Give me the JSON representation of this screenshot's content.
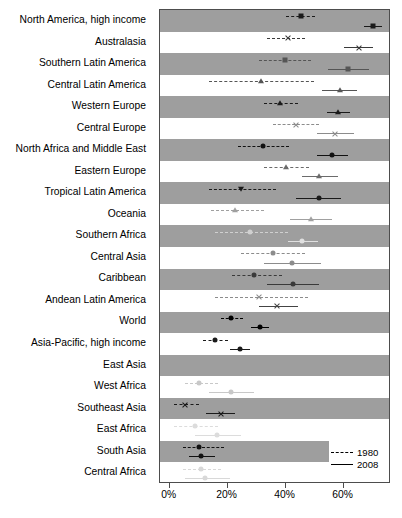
{
  "chart_data": {
    "type": "scatter",
    "title": "",
    "subtitle": "",
    "xlabel": "",
    "ylabel": "",
    "xlim": [
      -3,
      76
    ],
    "grid": false,
    "legend_position": "bottom-right",
    "axis": {
      "ticks": [
        0,
        20,
        40,
        60
      ],
      "tick_labels": [
        "0%",
        "20%",
        "40%",
        "60%"
      ]
    },
    "legend": [
      {
        "name": "1980",
        "style": "dashed",
        "label": "1980"
      },
      {
        "name": "2008",
        "style": "solid",
        "label": "2008"
      }
    ],
    "categories": [
      "North America, high income",
      "Australasia",
      "Southern Latin America",
      "Central Latin America",
      "Western Europe",
      "Central Europe",
      "North Africa and Middle East",
      "Eastern Europe",
      "Tropical Latin America",
      "Oceania",
      "Southern Africa",
      "Central Asia",
      "Caribbean",
      "Andean Latin America",
      "World",
      "Asia-Pacific, high income",
      "East Asia",
      "West Africa",
      "Southeast Asia",
      "East Africa",
      "South Asia",
      "Central Africa"
    ],
    "series": [
      {
        "name": "1980",
        "style": "dashed",
        "points": [
          {
            "category": "North America, high income",
            "value": 45.5,
            "low": 40.5,
            "high": 50.5,
            "marker": "square",
            "color": "#1a1a1a"
          },
          {
            "category": "Australasia",
            "value": 41.0,
            "low": 34.0,
            "high": 47.0,
            "marker": "cross",
            "color": "#3a3a3a"
          },
          {
            "category": "Southern Latin America",
            "value": 40.0,
            "low": 31.0,
            "high": 49.0,
            "marker": "square",
            "color": "#555555"
          },
          {
            "category": "Central Latin America",
            "value": 32.0,
            "low": 14.0,
            "high": 50.0,
            "marker": "triangle",
            "color": "#555555"
          },
          {
            "category": "Western Europe",
            "value": 38.5,
            "low": 33.0,
            "high": 44.5,
            "marker": "triangle",
            "color": "#1a1a1a"
          },
          {
            "category": "Central Europe",
            "value": 44.0,
            "low": 36.0,
            "high": 52.0,
            "marker": "cross",
            "color": "#8c8c8c"
          },
          {
            "category": "North Africa and Middle East",
            "value": 32.5,
            "low": 24.0,
            "high": 41.5,
            "marker": "circle",
            "color": "#111111"
          },
          {
            "category": "Eastern Europe",
            "value": 40.5,
            "low": 33.0,
            "high": 48.5,
            "marker": "triangle",
            "color": "#6b6b6b"
          },
          {
            "category": "Tropical Latin America",
            "value": 25.0,
            "low": 14.0,
            "high": 37.0,
            "marker": "tri-down",
            "color": "#1a1a1a"
          },
          {
            "category": "Oceania",
            "value": 23.0,
            "low": 14.5,
            "high": 33.0,
            "marker": "triangle",
            "color": "#a0a0a0"
          },
          {
            "category": "Southern Africa",
            "value": 28.0,
            "low": 16.0,
            "high": 41.0,
            "marker": "circle",
            "color": "#d0d0d0"
          },
          {
            "category": "Central Asia",
            "value": 36.0,
            "low": 25.0,
            "high": 47.0,
            "marker": "circle",
            "color": "#8c8c8c"
          },
          {
            "category": "Caribbean",
            "value": 29.5,
            "low": 22.0,
            "high": 39.0,
            "marker": "circle",
            "color": "#3a3a3a"
          },
          {
            "category": "Andean Latin America",
            "value": 31.0,
            "low": 16.0,
            "high": 48.0,
            "marker": "cross",
            "color": "#8c8c8c"
          },
          {
            "category": "World",
            "value": 21.5,
            "low": 18.0,
            "high": 25.5,
            "marker": "circle",
            "color": "#000000"
          },
          {
            "category": "Asia-Pacific, high income",
            "value": 16.0,
            "low": 12.0,
            "high": 20.5,
            "marker": "circle",
            "color": "#1a1a1a"
          },
          {
            "category": "East Asia",
            "value": null,
            "low": null,
            "high": null,
            "marker": "circle",
            "color": "#c8c8c8"
          },
          {
            "category": "West Africa",
            "value": 10.5,
            "low": 5.5,
            "high": 17.0,
            "marker": "circle",
            "color": "#c8c8c8"
          },
          {
            "category": "Southeast Asia",
            "value": 5.5,
            "low": 2.0,
            "high": 10.5,
            "marker": "cross",
            "color": "#1a1a1a"
          },
          {
            "category": "East Africa",
            "value": 9.0,
            "low": 2.0,
            "high": 17.0,
            "marker": "circle",
            "color": "#dcdcdc"
          },
          {
            "category": "South Asia",
            "value": 10.5,
            "low": 5.0,
            "high": 19.0,
            "marker": "circle",
            "color": "#111111"
          },
          {
            "category": "Central Africa",
            "value": 11.0,
            "low": 5.0,
            "high": 18.0,
            "marker": "circle",
            "color": "#d8d8d8"
          }
        ]
      },
      {
        "name": "2008",
        "style": "solid",
        "points": [
          {
            "category": "North America, high income",
            "value": 70.5,
            "low": 67.5,
            "high": 73.5,
            "marker": "square",
            "color": "#1a1a1a"
          },
          {
            "category": "Australasia",
            "value": 65.5,
            "low": 60.5,
            "high": 70.5,
            "marker": "cross",
            "color": "#3a3a3a"
          },
          {
            "category": "Southern Latin America",
            "value": 62.0,
            "low": 55.0,
            "high": 69.0,
            "marker": "square",
            "color": "#555555"
          },
          {
            "category": "Central Latin America",
            "value": 59.0,
            "low": 53.0,
            "high": 65.0,
            "marker": "triangle",
            "color": "#555555"
          },
          {
            "category": "Western Europe",
            "value": 58.5,
            "low": 54.5,
            "high": 62.5,
            "marker": "triangle",
            "color": "#1a1a1a"
          },
          {
            "category": "Central Europe",
            "value": 57.5,
            "low": 51.0,
            "high": 64.0,
            "marker": "cross",
            "color": "#8c8c8c"
          },
          {
            "category": "North Africa and Middle East",
            "value": 56.5,
            "low": 51.0,
            "high": 62.0,
            "marker": "circle",
            "color": "#111111"
          },
          {
            "category": "Eastern Europe",
            "value": 52.0,
            "low": 46.0,
            "high": 58.5,
            "marker": "triangle",
            "color": "#6b6b6b"
          },
          {
            "category": "Tropical Latin America",
            "value": 52.0,
            "low": 44.0,
            "high": 59.5,
            "marker": "circle",
            "color": "#1a1a1a"
          },
          {
            "category": "Oceania",
            "value": 49.0,
            "low": 42.0,
            "high": 56.5,
            "marker": "triangle",
            "color": "#a0a0a0"
          },
          {
            "category": "Southern Africa",
            "value": 46.0,
            "low": 41.0,
            "high": 51.5,
            "marker": "circle",
            "color": "#e0e0e0"
          },
          {
            "category": "Central Asia",
            "value": 42.5,
            "low": 33.0,
            "high": 52.5,
            "marker": "circle",
            "color": "#8c8c8c"
          },
          {
            "category": "Caribbean",
            "value": 43.0,
            "low": 34.0,
            "high": 52.0,
            "marker": "circle",
            "color": "#3a3a3a"
          },
          {
            "category": "Andean Latin America",
            "value": 37.5,
            "low": 31.0,
            "high": 44.5,
            "marker": "cross",
            "color": "#444444"
          },
          {
            "category": "World",
            "value": 31.5,
            "low": 28.5,
            "high": 34.5,
            "marker": "circle",
            "color": "#000000"
          },
          {
            "category": "Asia-Pacific, high income",
            "value": 24.5,
            "low": 21.0,
            "high": 28.0,
            "marker": "circle",
            "color": "#1a1a1a"
          },
          {
            "category": "East Asia",
            "value": null,
            "low": null,
            "high": null,
            "marker": "circle",
            "color": "#c8c8c8"
          },
          {
            "category": "West Africa",
            "value": 21.5,
            "low": 14.0,
            "high": 29.5,
            "marker": "circle",
            "color": "#c8c8c8"
          },
          {
            "category": "Southeast Asia",
            "value": 18.0,
            "low": 13.0,
            "high": 23.0,
            "marker": "cross",
            "color": "#1a1a1a"
          },
          {
            "category": "East Africa",
            "value": 16.5,
            "low": 9.0,
            "high": 25.0,
            "marker": "circle",
            "color": "#dcdcdc"
          },
          {
            "category": "South Asia",
            "value": 11.0,
            "low": 7.0,
            "high": 16.0,
            "marker": "circle",
            "color": "#111111"
          },
          {
            "category": "Central Africa",
            "value": 12.5,
            "low": 5.5,
            "high": 21.0,
            "marker": "circle",
            "color": "#d8d8d8"
          }
        ]
      }
    ],
    "banded_rows": [
      {
        "category": "North America, high income",
        "shaded": true,
        "width_pct": 100
      },
      {
        "category": "Australasia",
        "shaded": false,
        "width_pct": 100
      },
      {
        "category": "Southern Latin America",
        "shaded": true,
        "width_pct": 100
      },
      {
        "category": "Central Latin America",
        "shaded": false,
        "width_pct": 100
      },
      {
        "category": "Western Europe",
        "shaded": true,
        "width_pct": 100
      },
      {
        "category": "Central Europe",
        "shaded": false,
        "width_pct": 100
      },
      {
        "category": "North Africa and Middle East",
        "shaded": true,
        "width_pct": 100
      },
      {
        "category": "Eastern Europe",
        "shaded": false,
        "width_pct": 100
      },
      {
        "category": "Tropical Latin America",
        "shaded": true,
        "width_pct": 100
      },
      {
        "category": "Oceania",
        "shaded": false,
        "width_pct": 100
      },
      {
        "category": "Southern Africa",
        "shaded": true,
        "width_pct": 100
      },
      {
        "category": "Central Asia",
        "shaded": false,
        "width_pct": 100
      },
      {
        "category": "Caribbean",
        "shaded": true,
        "width_pct": 100
      },
      {
        "category": "Andean Latin America",
        "shaded": false,
        "width_pct": 100
      },
      {
        "category": "World",
        "shaded": true,
        "width_pct": 100
      },
      {
        "category": "Asia-Pacific, high income",
        "shaded": false,
        "width_pct": 100
      },
      {
        "category": "East Asia",
        "shaded": true,
        "width_pct": 100
      },
      {
        "category": "West Africa",
        "shaded": false,
        "width_pct": 100
      },
      {
        "category": "Southeast Asia",
        "shaded": true,
        "width_pct": 100
      },
      {
        "category": "East Africa",
        "shaded": false,
        "width_pct": 100
      },
      {
        "category": "South Asia",
        "shaded": true,
        "width_pct": 74
      },
      {
        "category": "Central Africa",
        "shaded": false,
        "width_pct": 100
      }
    ],
    "colors": {
      "band": "#9e9e9e",
      "panel_border": "#4d4d4d",
      "background": "#ffffff",
      "text": "#000000"
    }
  }
}
